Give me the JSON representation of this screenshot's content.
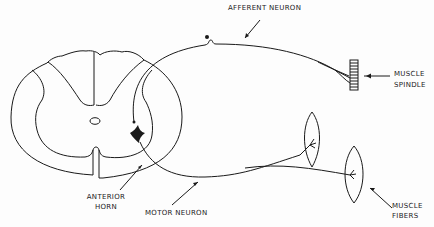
{
  "diagram": {
    "type": "reflex arc schematic",
    "labels": {
      "afferent_neuron": "AFFERENT NEURON",
      "muscle_spindle_line1": "MUSCLE",
      "muscle_spindle_line2": "SPINDLE",
      "anterior_horn_line1": "ANTERIOR",
      "anterior_horn_line2": "HORN",
      "motor_neuron": "MOTOR NEURON",
      "muscle_fibers_line1": "MUSCLE",
      "muscle_fibers_line2": "FIBERS"
    },
    "colors": {
      "line": "#1a1a1a",
      "background": "#fdfdfd"
    }
  }
}
